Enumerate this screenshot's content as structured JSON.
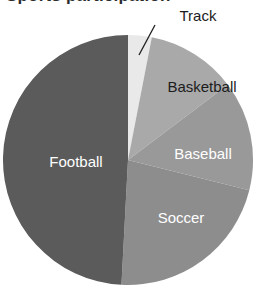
{
  "title": {
    "text": "Sports participation",
    "cropped": true,
    "note": "title is cut off at top edge of screenshot; only descenders visible"
  },
  "chart_data": {
    "type": "pie",
    "title": "Sports participation",
    "xlabel": "",
    "ylabel": "",
    "legend_position": "none",
    "labels_inside": true,
    "start_angle_deg": 0,
    "direction": "clockwise",
    "categories": [
      "Track",
      "Basketball",
      "Baseball",
      "Soccer",
      "Football"
    ],
    "values": [
      3,
      11.5,
      14,
      22,
      49.5
    ],
    "value_unit": "percent",
    "slices": [
      {
        "name": "Track",
        "label": "Track",
        "value": 3,
        "start_deg": 0,
        "end_deg": 11,
        "color": "#e9e9e9",
        "label_placement": "external",
        "label_color": "#1c1c1c",
        "label_x": 198,
        "label_y": 17,
        "leader_from_x": 155,
        "leader_from_y": 25,
        "leader_to_x": 139,
        "leader_to_y": 55
      },
      {
        "name": "Basketball",
        "label": "Basketball",
        "value": 11.5,
        "start_deg": 11,
        "end_deg": 53,
        "color": "#a9a9a9",
        "label_placement": "inside",
        "label_color": "#1c1c1c",
        "label_x": 202,
        "label_y": 88
      },
      {
        "name": "Baseball",
        "label": "Baseball",
        "value": 14,
        "start_deg": 53,
        "end_deg": 104,
        "color": "#999999",
        "label_placement": "inside",
        "label_color": "#ffffff",
        "label_x": 203,
        "label_y": 155
      },
      {
        "name": "Soccer",
        "label": "Soccer",
        "value": 22,
        "start_deg": 104,
        "end_deg": 183,
        "color": "#8d8d8d",
        "label_placement": "inside",
        "label_color": "#ffffff",
        "label_x": 181,
        "label_y": 219
      },
      {
        "name": "Football",
        "label": "Football",
        "value": 49.5,
        "start_deg": 183,
        "end_deg": 360,
        "color": "#5b5b5b",
        "label_placement": "inside",
        "label_color": "#ffffff",
        "label_x": 76,
        "label_y": 163
      }
    ],
    "geometry": {
      "center_x": 128,
      "center_y": 160,
      "radius": 125
    }
  }
}
